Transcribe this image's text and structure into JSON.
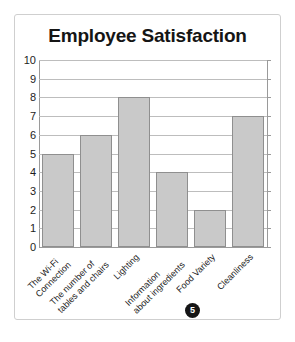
{
  "chart_data": {
    "type": "bar",
    "title": "Employee Satisfaction",
    "xlabel": "",
    "ylabel": "",
    "ylim": [
      0,
      10
    ],
    "ytick_step": 1,
    "yticks": [
      10,
      9,
      8,
      7,
      6,
      5,
      4,
      3,
      2,
      1,
      0
    ],
    "grid": true,
    "legend": false,
    "categories": [
      "The Wi-Fi Connection",
      "The number of tables and chairs",
      "Lighting",
      "Information about ingredients",
      "Food Variety",
      "Cleanliness"
    ],
    "category_lines": [
      [
        "The Wi-Fi",
        "Connection"
      ],
      [
        "The number of",
        "tables and chairs"
      ],
      [
        "Lighting",
        ""
      ],
      [
        "Information",
        "about ingredients"
      ],
      [
        "Food Variety",
        ""
      ],
      [
        "Cleanliness",
        ""
      ]
    ],
    "values": [
      5,
      6,
      8,
      4,
      2,
      7
    ],
    "bar_color": "#c9c9c9",
    "bar_edge_color": "#8f8f8f",
    "grid_color": "#bdbdbd",
    "axis_color": "#9a9a9a"
  },
  "annotation": {
    "badge_label": "5",
    "badge_color": "#151515",
    "badge_text_color": "#ffffff"
  }
}
